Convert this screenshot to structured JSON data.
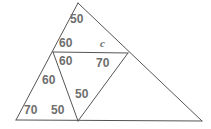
{
  "figure": {
    "stroke_color": "#555555",
    "label_color": "#6e6e6e",
    "background_color": "#ffffff",
    "width": 211,
    "height": 129
  },
  "points": {
    "apex": {
      "x": 78,
      "y": 3
    },
    "mid_left": {
      "x": 53,
      "y": 52
    },
    "mid_right": {
      "x": 128,
      "y": 53
    },
    "bottom_left": {
      "x": 16,
      "y": 120
    },
    "bottom_mid": {
      "x": 78,
      "y": 121
    },
    "bottom_right": {
      "x": 202,
      "y": 121
    }
  },
  "segments": [
    {
      "name": "apex-to-bottom-left",
      "from": "apex",
      "to": "bottom_left"
    },
    {
      "name": "apex-to-bottom-right",
      "from": "apex",
      "to": "bottom_right"
    },
    {
      "name": "baseline",
      "from": "bottom_left",
      "to": "bottom_right"
    },
    {
      "name": "horizontal-transversal",
      "from": "mid_left",
      "to": "mid_right"
    },
    {
      "name": "mid-left-to-bottom-mid",
      "from": "mid_left",
      "to": "bottom_mid"
    },
    {
      "name": "mid-right-to-bottom-mid",
      "from": "mid_right",
      "to": "bottom_mid"
    }
  ],
  "labels": [
    {
      "id": "top-apex-angle",
      "text": "50",
      "x": 70,
      "y": 13
    },
    {
      "id": "upper-left-angle",
      "text": "60",
      "x": 59,
      "y": 37
    },
    {
      "id": "unknown-angle",
      "text": "c",
      "x": 100,
      "y": 38
    },
    {
      "id": "lower-left-angle",
      "text": "60",
      "x": 59,
      "y": 55
    },
    {
      "id": "right-interior-angle",
      "text": "70",
      "x": 96,
      "y": 57
    },
    {
      "id": "mid-left-lower-angle",
      "text": "60",
      "x": 42,
      "y": 74
    },
    {
      "id": "center-bottom-angle",
      "text": "50",
      "x": 75,
      "y": 88
    },
    {
      "id": "bottom-left-angle",
      "text": "70",
      "x": 24,
      "y": 104
    },
    {
      "id": "bottom-mid-left-angle",
      "text": "50",
      "x": 51,
      "y": 104
    }
  ]
}
